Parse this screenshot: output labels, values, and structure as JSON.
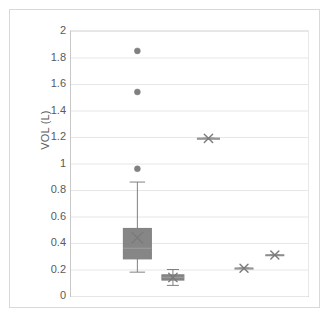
{
  "chart_data": {
    "type": "box",
    "title": "",
    "xlabel": "",
    "ylabel": "VOL (L)",
    "ylim": [
      0,
      2
    ],
    "ytick_labels": [
      "2",
      "1.8",
      "1.6",
      "1.4",
      "1.2",
      "1",
      "0.8",
      "0.6",
      "0.4",
      "0.2",
      "0"
    ],
    "ytick_values": [
      2,
      1.8,
      1.6,
      1.4,
      1.2,
      1,
      0.8,
      0.6,
      0.4,
      0.2,
      0
    ],
    "grid": true,
    "legend": "none",
    "xtick_labels": [],
    "series": [
      {
        "name": "box-1",
        "type": "box",
        "x_position": 0.28,
        "whisker_low": 0.18,
        "q1": 0.28,
        "median": 0.36,
        "q3": 0.51,
        "whisker_high": 0.86,
        "mean": 0.44,
        "box_width_px": 28,
        "outliers": [
          1.85,
          1.54,
          0.96
        ]
      },
      {
        "name": "box-2",
        "type": "box",
        "x_position": 0.43,
        "whisker_low": 0.08,
        "q1": 0.12,
        "median": 0.14,
        "q3": 0.16,
        "whisker_high": 0.2,
        "mean": 0.14,
        "box_width_px": 22,
        "outliers": []
      },
      {
        "name": "box-3",
        "type": "box",
        "x_position": 0.58,
        "whisker_low": 1.19,
        "q1": 1.19,
        "median": 1.19,
        "q3": 1.19,
        "whisker_high": 1.19,
        "mean": 1.19,
        "box_width_px": 22,
        "outliers": []
      },
      {
        "name": "box-4",
        "type": "box",
        "x_position": 0.73,
        "whisker_low": 0.21,
        "q1": 0.21,
        "median": 0.21,
        "q3": 0.21,
        "whisker_high": 0.21,
        "mean": 0.21,
        "box_width_px": 18,
        "outliers": []
      },
      {
        "name": "box-5",
        "type": "box",
        "x_position": 0.86,
        "whisker_low": 0.31,
        "q1": 0.31,
        "median": 0.31,
        "q3": 0.31,
        "whisker_high": 0.31,
        "mean": 0.31,
        "box_width_px": 18,
        "outliers": []
      }
    ],
    "colors": {
      "box_fill": "#808080",
      "box_stroke": "#7f7f7f",
      "whisker": "#808080",
      "marker": "#7a7a7a",
      "outlier": "#808080",
      "grid": "#e6e6e6",
      "axis": "#c0c0c0",
      "text": "#5a5a5a"
    }
  }
}
